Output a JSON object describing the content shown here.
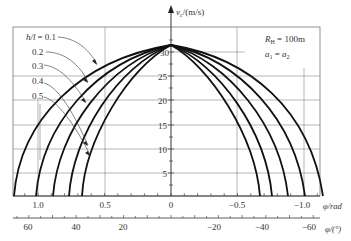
{
  "chart_data": {
    "type": "line",
    "title": "",
    "xlabel": "φ/rad",
    "xlabel_secondary": "φ/(°)",
    "ylabel": "v_c/(m/s)",
    "xlim": [
      1.2,
      -1.2
    ],
    "ylim": [
      0,
      35
    ],
    "x_ticks_rad": [
      "1.0",
      "0.5",
      "0",
      "−0.5",
      "−1.0"
    ],
    "x_ticks_deg": [
      "60",
      "40",
      "20",
      "−20",
      "−40",
      "−60"
    ],
    "y_ticks": [
      "5",
      "10",
      "15",
      "20",
      "25",
      "30"
    ],
    "grid": true,
    "annotations": {
      "R": "R",
      "R_sub": "H",
      "R_value": "=100m",
      "a_eq": "a1 = a2",
      "a1": "a",
      "a1_sub": "1",
      "eq": " = ",
      "a2": "a",
      "a2_sub": "2"
    },
    "legend_title": "h/l = 0.1",
    "legend_prefix": "h/l",
    "series": [
      {
        "name": "0.1",
        "phi_left_end": 1.18,
        "phi_right_end": -1.14,
        "v_peak": 31.3
      },
      {
        "name": "0.2",
        "phi_left_end": 1.02,
        "phi_right_end": -1.01,
        "v_peak": 31.3
      },
      {
        "name": "0.3",
        "phi_left_end": 0.89,
        "phi_right_end": -0.88,
        "v_peak": 31.3
      },
      {
        "name": "0.4",
        "phi_left_end": 0.77,
        "phi_right_end": -0.76,
        "v_peak": 31.3
      },
      {
        "name": "0.5",
        "phi_left_end": 0.67,
        "phi_right_end": -0.67,
        "v_peak": 31.3
      }
    ]
  },
  "labels": {
    "legend_01": "= 0.1",
    "legend_02": "0.2",
    "legend_03": "0.3",
    "legend_04": "0.4",
    "legend_05": "0.5",
    "h_over_l": "h/l",
    "y_axis_v": "v",
    "y_axis_sub": "c",
    "y_axis_unit": "/(m/s)",
    "x_rad_label": "φ/rad",
    "x_deg_label": "φ/(°)",
    "R_main": "R",
    "R_sub": "H",
    "R_val": " = 100m",
    "a1": "a",
    "a1_sub": "1",
    "a_eq": " = ",
    "a2": "a",
    "a2_sub": "2",
    "y30": "30",
    "y25": "25",
    "y20": "20",
    "y15": "15",
    "y10": "10",
    "y5": "5",
    "xr10": "1.0",
    "xr05": "0.5",
    "xr0": "0",
    "xrm05": "−0.5",
    "xrm10": "−1.0",
    "xd60": "60",
    "xd40": "40",
    "xd20": "20",
    "xdm20": "−20",
    "xdm40": "−40",
    "xdm60": "−60"
  }
}
